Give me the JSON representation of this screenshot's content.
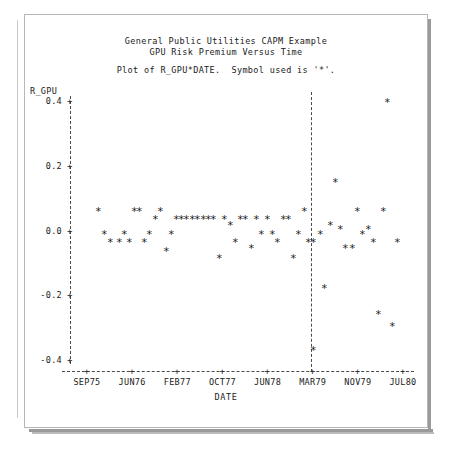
{
  "window": {
    "frame_color": "#b7b7b7",
    "background": "#ffffff"
  },
  "titles": {
    "line1": "General Public Utilities CAPM Example",
    "line2": "GPU Risk Premium Versus Time",
    "subtitle": "Plot of R_GPU*DATE.  Symbol used is '*'."
  },
  "chart_data": {
    "type": "scatter",
    "title": "General Public Utilities CAPM Example",
    "subtitle": "GPU Risk Premium Versus Time",
    "annotation": "Plot of R_GPU*DATE.  Symbol used is '*'.",
    "symbol": "*",
    "xlabel": "DATE",
    "ylabel": "R_GPU",
    "grid": false,
    "legend": null,
    "ylim": [
      -0.45,
      0.45
    ],
    "yticks": [
      "0.4",
      "0.2",
      "0.0",
      "-0.2",
      "-0.4"
    ],
    "ytick_values": [
      0.4,
      0.2,
      0.0,
      -0.2,
      -0.4
    ],
    "xticks": [
      "SEP75",
      "JUN76",
      "FEB77",
      "OCT77",
      "JUN78",
      "MAR79",
      "NOV79",
      "JUL80"
    ],
    "reference_line_x": "MAR79",
    "point_color": "#1d1d1d",
    "points": [
      {
        "x": 98,
        "y": 0.055
      },
      {
        "x": 104,
        "y": -0.018
      },
      {
        "x": 110,
        "y": -0.042
      },
      {
        "x": 119,
        "y": -0.042
      },
      {
        "x": 124,
        "y": -0.018
      },
      {
        "x": 129,
        "y": -0.042
      },
      {
        "x": 134,
        "y": 0.055
      },
      {
        "x": 139,
        "y": 0.055
      },
      {
        "x": 144,
        "y": -0.042
      },
      {
        "x": 149,
        "y": -0.018
      },
      {
        "x": 155,
        "y": 0.03
      },
      {
        "x": 160,
        "y": 0.055
      },
      {
        "x": 166,
        "y": -0.07
      },
      {
        "x": 171,
        "y": -0.018
      },
      {
        "x": 176,
        "y": 0.03
      },
      {
        "x": 181,
        "y": 0.03
      },
      {
        "x": 186,
        "y": 0.03
      },
      {
        "x": 192,
        "y": 0.03
      },
      {
        "x": 197,
        "y": 0.03
      },
      {
        "x": 203,
        "y": 0.03
      },
      {
        "x": 208,
        "y": 0.03
      },
      {
        "x": 213,
        "y": 0.03
      },
      {
        "x": 219,
        "y": -0.09
      },
      {
        "x": 224,
        "y": 0.03
      },
      {
        "x": 230,
        "y": 0.012
      },
      {
        "x": 235,
        "y": -0.042
      },
      {
        "x": 240,
        "y": 0.03
      },
      {
        "x": 245,
        "y": 0.03
      },
      {
        "x": 251,
        "y": -0.06
      },
      {
        "x": 256,
        "y": 0.03
      },
      {
        "x": 261,
        "y": -0.018
      },
      {
        "x": 267,
        "y": 0.03
      },
      {
        "x": 272,
        "y": -0.018
      },
      {
        "x": 277,
        "y": -0.042
      },
      {
        "x": 283,
        "y": 0.03
      },
      {
        "x": 288,
        "y": 0.03
      },
      {
        "x": 293,
        "y": -0.09
      },
      {
        "x": 298,
        "y": -0.018
      },
      {
        "x": 304,
        "y": 0.055
      },
      {
        "x": 308,
        "y": -0.042
      },
      {
        "x": 313,
        "y": -0.042
      },
      {
        "x": 313,
        "y": -0.375
      },
      {
        "x": 320,
        "y": -0.018
      },
      {
        "x": 324,
        "y": -0.185
      },
      {
        "x": 330,
        "y": 0.012
      },
      {
        "x": 335,
        "y": 0.145
      },
      {
        "x": 340,
        "y": 0.0
      },
      {
        "x": 345,
        "y": -0.06
      },
      {
        "x": 352,
        "y": -0.06
      },
      {
        "x": 357,
        "y": 0.055
      },
      {
        "x": 362,
        "y": -0.018
      },
      {
        "x": 368,
        "y": 0.0
      },
      {
        "x": 373,
        "y": -0.042
      },
      {
        "x": 378,
        "y": -0.265
      },
      {
        "x": 383,
        "y": 0.055
      },
      {
        "x": 387,
        "y": 0.39
      },
      {
        "x": 392,
        "y": -0.3
      },
      {
        "x": 397,
        "y": -0.042
      }
    ]
  },
  "axes": {
    "tick_symbol": "+",
    "axis_color": "#4a4a4a"
  }
}
